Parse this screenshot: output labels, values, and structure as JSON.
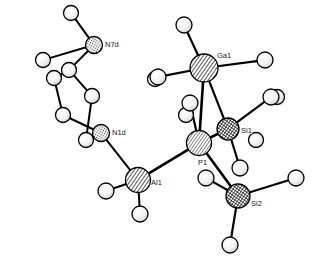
{
  "figure": {
    "kind": "crystal-structure-ellipsoid-plot",
    "background_color": "#ffffff",
    "outline_color": "#000000",
    "width": 312,
    "height": 260
  },
  "labels": {
    "N7d": "N7d",
    "N1d": "N1d",
    "Ga1": "Ga1",
    "Si1": "Si1",
    "Si2": "Si2",
    "P1": "P1",
    "Al1": "Al1"
  },
  "atoms": [
    {
      "id": "N7d",
      "element": "N",
      "label": "N7d",
      "cx": 94,
      "cy": 45,
      "r": 8.5,
      "fill": "hatch-dots-fine",
      "label_dx": 11,
      "label_dy": 2
    },
    {
      "id": "H7a",
      "element": "H",
      "label": "",
      "cx": 71,
      "cy": 13,
      "r": 7.5,
      "fill": "sphere-light"
    },
    {
      "id": "H7b",
      "element": "H",
      "label": "",
      "cx": 43,
      "cy": 60,
      "r": 7.5,
      "fill": "sphere-light"
    },
    {
      "id": "C1",
      "element": "C",
      "label": "",
      "cx": 155,
      "cy": 79,
      "r": 7.5,
      "fill": "sphere-light"
    },
    {
      "id": "C2",
      "element": "C",
      "label": "",
      "cx": 207,
      "cy": 70,
      "r": 7.5,
      "fill": "sphere-light"
    },
    {
      "id": "C3",
      "element": "C",
      "label": "",
      "cx": 277,
      "cy": 97,
      "r": 7.5,
      "fill": "sphere-light"
    },
    {
      "id": "C4",
      "element": "C",
      "label": "",
      "cx": 186,
      "cy": 115,
      "r": 7.5,
      "fill": "sphere-light"
    },
    {
      "id": "C5",
      "element": "C",
      "label": "",
      "cx": 256,
      "cy": 140,
      "r": 7.5,
      "fill": "sphere-light"
    },
    {
      "id": "N1d",
      "element": "N",
      "label": "N1d",
      "cx": 101,
      "cy": 133,
      "r": 8.5,
      "fill": "hatch-dots-fine",
      "label_dx": 11,
      "label_dy": 2
    },
    {
      "id": "Ga1",
      "element": "Ga",
      "label": "Ga1",
      "cx": 204,
      "cy": 68,
      "r": 14,
      "fill": "hatch-diag",
      "label_dx": 13,
      "label_dy": -10
    },
    {
      "id": "GaH1",
      "element": "H",
      "label": "",
      "cx": 184,
      "cy": 25,
      "r": 8,
      "fill": "sphere-light"
    },
    {
      "id": "GaH2",
      "element": "H",
      "label": "",
      "cx": 158,
      "cy": 77,
      "r": 8,
      "fill": "sphere-light"
    },
    {
      "id": "GaH3",
      "element": "H",
      "label": "",
      "cx": 265,
      "cy": 60,
      "r": 8,
      "fill": "sphere-light"
    },
    {
      "id": "P1",
      "element": "P",
      "label": "P1",
      "cx": 199,
      "cy": 143,
      "r": 12.5,
      "fill": "hatch-diag-fine",
      "label_dx": -1,
      "label_dy": 22
    },
    {
      "id": "PH1",
      "element": "H",
      "label": "",
      "cx": 190,
      "cy": 103,
      "r": 8,
      "fill": "sphere-light"
    },
    {
      "id": "Si1",
      "element": "Si",
      "label": "Si1",
      "cx": 228,
      "cy": 129,
      "r": 11,
      "fill": "hatch-cross",
      "label_dx": 13,
      "label_dy": 4
    },
    {
      "id": "Si1H1",
      "element": "H",
      "label": "",
      "cx": 271,
      "cy": 97,
      "r": 8,
      "fill": "sphere-light"
    },
    {
      "id": "Si1H2",
      "element": "H",
      "label": "",
      "cx": 240,
      "cy": 168,
      "r": 8,
      "fill": "sphere-light"
    },
    {
      "id": "Si2",
      "element": "Si",
      "label": "Si2",
      "cx": 238,
      "cy": 196,
      "r": 12,
      "fill": "hatch-cross",
      "label_dx": 13,
      "label_dy": 10
    },
    {
      "id": "Si2H1",
      "element": "H",
      "label": "",
      "cx": 296,
      "cy": 178,
      "r": 8,
      "fill": "sphere-light"
    },
    {
      "id": "Si2H2",
      "element": "H",
      "label": "",
      "cx": 206,
      "cy": 178,
      "r": 8,
      "fill": "sphere-light"
    },
    {
      "id": "Si2H3",
      "element": "H",
      "label": "",
      "cx": 230,
      "cy": 245,
      "r": 8,
      "fill": "sphere-light"
    },
    {
      "id": "Al1",
      "element": "Al",
      "label": "Al1",
      "cx": 138,
      "cy": 180,
      "r": 12.5,
      "fill": "hatch-diag",
      "label_dx": 13,
      "label_dy": 5
    },
    {
      "id": "AlH1",
      "element": "H",
      "label": "",
      "cx": 106,
      "cy": 191,
      "r": 8,
      "fill": "sphere-light"
    },
    {
      "id": "AlH2",
      "element": "H",
      "label": "",
      "cx": 140,
      "cy": 214,
      "r": 8,
      "fill": "sphere-light"
    },
    {
      "id": "R1",
      "element": "C",
      "label": "",
      "cx": 54,
      "cy": 78,
      "r": 7.5,
      "fill": "sphere-light"
    },
    {
      "id": "R2",
      "element": "C",
      "label": "",
      "cx": 69,
      "cy": 70,
      "r": 7.5,
      "fill": "sphere-light"
    },
    {
      "id": "R3",
      "element": "C",
      "label": "",
      "cx": 92,
      "cy": 96,
      "r": 7.5,
      "fill": "sphere-light"
    },
    {
      "id": "R4",
      "element": "C",
      "label": "",
      "cx": 63,
      "cy": 115,
      "r": 7.5,
      "fill": "sphere-light"
    },
    {
      "id": "R5",
      "element": "C",
      "label": "",
      "cx": 86,
      "cy": 140,
      "r": 7.5,
      "fill": "sphere-light"
    }
  ],
  "bonds": [
    {
      "from": "H7a",
      "to": "N7d",
      "width": 2.0
    },
    {
      "from": "H7b",
      "to": "N7d",
      "width": 2.0
    },
    {
      "from": "N7d",
      "to": "R2",
      "width": 2.0
    },
    {
      "from": "R2",
      "to": "R1",
      "width": 2.0
    },
    {
      "from": "R2",
      "to": "R3",
      "width": 2.0
    },
    {
      "from": "R1",
      "to": "R4",
      "width": 2.0
    },
    {
      "from": "R3",
      "to": "R5",
      "width": 2.0
    },
    {
      "from": "R4",
      "to": "N1d",
      "width": 2.0
    },
    {
      "from": "R5",
      "to": "N1d",
      "width": 2.0
    },
    {
      "from": "N1d",
      "to": "Al1",
      "width": 2.0
    },
    {
      "from": "Al1",
      "to": "AlH1",
      "width": 2.0
    },
    {
      "from": "Al1",
      "to": "AlH2",
      "width": 2.0
    },
    {
      "from": "Al1",
      "to": "P1",
      "width": 2.6
    },
    {
      "from": "P1",
      "to": "PH1",
      "width": 2.2
    },
    {
      "from": "P1",
      "to": "Ga1",
      "width": 2.6
    },
    {
      "from": "P1",
      "to": "Si1",
      "width": 2.6
    },
    {
      "from": "P1",
      "to": "Si2",
      "width": 2.6
    },
    {
      "from": "Ga1",
      "to": "GaH1",
      "width": 2.2
    },
    {
      "from": "Ga1",
      "to": "GaH2",
      "width": 2.2
    },
    {
      "from": "Ga1",
      "to": "GaH3",
      "width": 2.2
    },
    {
      "from": "Si1",
      "to": "Si1H1",
      "width": 2.2
    },
    {
      "from": "Si1",
      "to": "Si1H2",
      "width": 2.2
    },
    {
      "from": "Si1",
      "to": "Ga1",
      "width": 2.2
    },
    {
      "from": "Si2",
      "to": "Si2H1",
      "width": 2.2
    },
    {
      "from": "Si2",
      "to": "Si2H2",
      "width": 2.2
    },
    {
      "from": "Si2",
      "to": "Si2H3",
      "width": 2.2
    }
  ]
}
